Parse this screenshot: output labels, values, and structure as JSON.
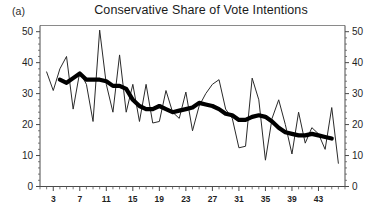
{
  "figure": {
    "panel_label": "(a)",
    "title": "Conservative Share of Vote Intentions"
  },
  "chart_data": {
    "type": "line",
    "title": "Conservative Share of Vote Intentions",
    "xlabel": "",
    "ylabel": "",
    "xlim": [
      1,
      47
    ],
    "ylim": [
      0,
      52
    ],
    "grid": false,
    "legend": "none",
    "left_axis": {
      "ticks": [
        0,
        10,
        20,
        30,
        40,
        50
      ],
      "tick_labels": [
        "0",
        "10",
        "20",
        "30",
        "40",
        "50"
      ]
    },
    "right_axis": {
      "ticks": [
        0,
        10,
        20,
        30,
        40,
        50
      ],
      "tick_labels": [
        "0",
        "10",
        "20",
        "30",
        "40",
        "50"
      ]
    },
    "x_axis": {
      "tick_labels": [
        "3",
        "7",
        "11",
        "15",
        "19",
        "23",
        "27",
        "31",
        "35",
        "39",
        "43"
      ],
      "tick_values": [
        3,
        7,
        11,
        15,
        19,
        23,
        27,
        31,
        35,
        39,
        43
      ],
      "minor_tick_step": 1
    },
    "x": [
      2,
      3,
      4,
      5,
      6,
      7,
      8,
      9,
      10,
      11,
      12,
      13,
      14,
      15,
      16,
      17,
      18,
      19,
      20,
      21,
      22,
      23,
      24,
      25,
      26,
      27,
      28,
      29,
      30,
      31,
      32,
      33,
      34,
      35,
      36,
      37,
      38,
      39,
      40,
      41,
      42,
      43,
      44,
      45,
      46
    ],
    "series": [
      {
        "name": "Monthly vote intention (raw)",
        "style": "thin",
        "values": [
          37,
          31,
          38,
          42,
          25,
          37,
          33,
          21,
          50.5,
          33,
          24,
          42.5,
          24,
          33,
          21,
          33,
          20.5,
          21,
          31,
          24,
          22,
          30.5,
          18,
          26,
          30,
          33,
          34.5,
          25,
          22,
          12.5,
          13,
          35,
          28,
          8.5,
          22,
          28,
          20,
          10.5,
          24,
          14,
          19,
          17,
          12,
          25.5,
          7.5
        ]
      },
      {
        "name": "Smoothed trend",
        "style": "thick",
        "values": [
          null,
          null,
          34.5,
          33.5,
          35,
          36.5,
          34.5,
          34.5,
          34.5,
          34,
          32.5,
          32.5,
          31.5,
          28,
          26,
          25,
          25,
          26,
          25,
          24,
          24.5,
          25,
          25.5,
          27,
          26.5,
          26,
          25,
          23.5,
          23,
          21.5,
          21.5,
          22.5,
          23,
          22.5,
          21,
          19,
          17.5,
          17,
          16.5,
          16.5,
          17,
          16.5,
          16,
          15.5,
          null
        ]
      }
    ]
  }
}
